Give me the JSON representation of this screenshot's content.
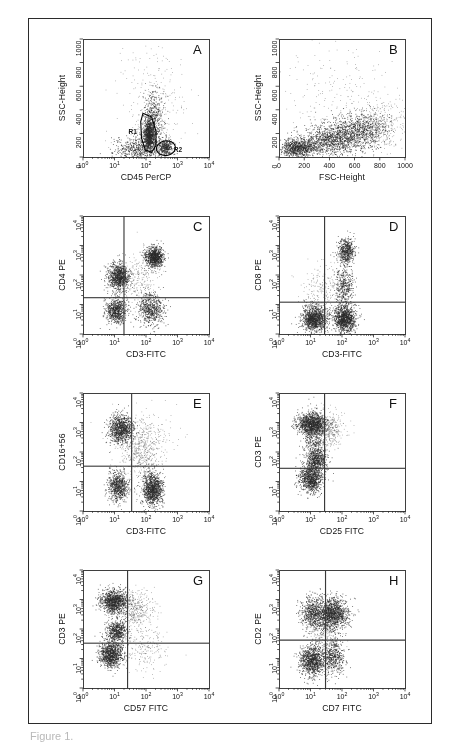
{
  "figure": {
    "caption_fragment": "Figure 1.",
    "panel_letters": [
      "A",
      "B",
      "C",
      "D",
      "E",
      "F",
      "G",
      "H"
    ],
    "colors": {
      "ink": "#1a1a1a",
      "frame": "#2b2b2b",
      "dot": "#2a2a2a",
      "quadrant": "#3a3a3a",
      "gate": "#000000",
      "background": "#ffffff"
    }
  },
  "chart_data": [
    {
      "id": "A",
      "type": "scatter",
      "title": "A",
      "xlabel": "CD45 PerCP",
      "ylabel": "SSC-Height",
      "x_scale": "log",
      "y_scale": "linear",
      "xlim": [
        1,
        10000
      ],
      "ylim": [
        0,
        1000
      ],
      "x_ticks": [
        "10^0",
        "10^1",
        "10^2",
        "10^3",
        "10^4"
      ],
      "y_ticks": [
        "0",
        "200",
        "400",
        "600",
        "800",
        "1000"
      ],
      "grid": false,
      "legend": "none",
      "n_events": 3000,
      "gates": [
        {
          "name": "R1",
          "shape": "polygon",
          "label": "R1",
          "label_xy": [
            28,
            210
          ],
          "vertices": [
            [
              80,
              370
            ],
            [
              150,
              340
            ],
            [
              210,
              215
            ],
            [
              205,
              95
            ],
            [
              150,
              40
            ],
            [
              95,
              60
            ],
            [
              72,
              160
            ],
            [
              68,
              300
            ]
          ]
        },
        {
          "name": "R2",
          "shape": "ellipse",
          "label": "R2",
          "label_xy": [
            760,
            60
          ],
          "center": [
            430,
            75
          ],
          "rx_log_decades": 0.3,
          "ry": 62,
          "rotation_deg": -8
        }
      ],
      "clusters": [
        {
          "name": "lymphocytes",
          "n": 900,
          "x_log_mean": 2.1,
          "x_log_sd": 0.09,
          "y_mean": 190,
          "y_sd": 65,
          "shape": "blob"
        },
        {
          "name": "monocytes",
          "n": 330,
          "x_log_mean": 2.62,
          "x_log_sd": 0.11,
          "y_mean": 80,
          "y_sd": 35,
          "shape": "blob"
        },
        {
          "name": "granulocytes",
          "n": 420,
          "x_log_mean": 2.22,
          "x_log_sd": 0.16,
          "y_mean": 330,
          "y_sd": 120,
          "shape": "blob"
        },
        {
          "name": "debris",
          "n": 520,
          "x_log_mean": 1.75,
          "x_log_sd": 0.38,
          "y_mean": 70,
          "y_sd": 55,
          "shape": "blob"
        },
        {
          "name": "scatter-noise",
          "n": 300,
          "x_log_mean": 2.25,
          "x_log_sd": 0.55,
          "y_mean": 430,
          "y_sd": 260,
          "shape": "sparse"
        }
      ]
    },
    {
      "id": "B",
      "type": "scatter",
      "title": "B",
      "xlabel": "FSC-Height",
      "ylabel": "SSC-Height",
      "x_scale": "linear",
      "y_scale": "linear",
      "xlim": [
        0,
        1000
      ],
      "ylim": [
        0,
        1000
      ],
      "x_ticks": [
        "0",
        "200",
        "400",
        "600",
        "800",
        "1000"
      ],
      "y_ticks": [
        "0",
        "200",
        "400",
        "600",
        "800",
        "1000"
      ],
      "grid": false,
      "legend": "none",
      "n_events": 3200,
      "gates": [],
      "clusters": [
        {
          "name": "low-fsc-dense",
          "n": 900,
          "x_mean": 150,
          "x_sd": 70,
          "y_mean": 75,
          "y_sd": 45,
          "shape": "blob"
        },
        {
          "name": "mid-diagonal",
          "n": 1000,
          "x_mean": 420,
          "x_sd": 120,
          "y_mean": 150,
          "y_sd": 65,
          "shape": "blob"
        },
        {
          "name": "upper-diagonal",
          "n": 750,
          "x_mean": 640,
          "x_sd": 110,
          "y_mean": 230,
          "y_sd": 75,
          "shape": "blob"
        },
        {
          "name": "high-fsc-tail",
          "n": 330,
          "x_mean": 820,
          "x_sd": 110,
          "y_mean": 280,
          "y_sd": 110,
          "shape": "sparse"
        },
        {
          "name": "sparse-upper",
          "n": 220,
          "x_mean": 480,
          "x_sd": 240,
          "y_mean": 520,
          "y_sd": 230,
          "shape": "sparse"
        }
      ]
    },
    {
      "id": "C",
      "type": "scatter",
      "title": "C",
      "xlabel": "CD3-FITC",
      "ylabel": "CD4 PE",
      "x_scale": "log",
      "y_scale": "log",
      "xlim": [
        1,
        10000
      ],
      "ylim": [
        1,
        10000
      ],
      "x_ticks": [
        "10^0",
        "10^1",
        "10^2",
        "10^3",
        "10^4"
      ],
      "y_ticks": [
        "10^0",
        "10^1",
        "10^2",
        "10^3",
        "10^4"
      ],
      "grid": false,
      "legend": "none",
      "n_events": 3400,
      "quadrant": {
        "x": 20,
        "y": 17
      },
      "gates": [],
      "clusters": [
        {
          "name": "cd3-neg-cd4-dim",
          "n": 950,
          "x_log_mean": 1.12,
          "x_log_sd": 0.17,
          "y_log_mean": 1.95,
          "y_log_sd": 0.22,
          "shape": "blob"
        },
        {
          "name": "cd3-pos-cd4-pos",
          "n": 900,
          "x_log_mean": 2.25,
          "x_log_sd": 0.14,
          "y_log_mean": 2.62,
          "y_log_sd": 0.17,
          "shape": "blob"
        },
        {
          "name": "double-negative",
          "n": 700,
          "x_log_mean": 1.05,
          "x_log_sd": 0.16,
          "y_log_mean": 0.8,
          "y_log_sd": 0.22,
          "shape": "blob"
        },
        {
          "name": "cd3-pos-cd4-neg",
          "n": 620,
          "x_log_mean": 2.15,
          "x_log_sd": 0.21,
          "y_log_mean": 0.85,
          "y_log_sd": 0.28,
          "shape": "blob"
        },
        {
          "name": "bridge",
          "n": 230,
          "x_log_mean": 1.8,
          "x_log_sd": 0.3,
          "y_log_mean": 1.9,
          "y_log_sd": 0.45,
          "shape": "sparse"
        }
      ]
    },
    {
      "id": "D",
      "type": "scatter",
      "title": "D",
      "xlabel": "CD3-FITC",
      "ylabel": "CD8 PE",
      "x_scale": "log",
      "y_scale": "log",
      "xlim": [
        1,
        10000
      ],
      "ylim": [
        1,
        10000
      ],
      "x_ticks": [
        "10^0",
        "10^1",
        "10^2",
        "10^3",
        "10^4"
      ],
      "y_ticks": [
        "10^0",
        "10^1",
        "10^2",
        "10^3",
        "10^4"
      ],
      "grid": false,
      "legend": "none",
      "n_events": 3400,
      "quadrant": {
        "x": 28,
        "y": 12
      },
      "gates": [],
      "clusters": [
        {
          "name": "cd3-pos-cd8-bright",
          "n": 520,
          "x_log_mean": 2.13,
          "x_log_sd": 0.13,
          "y_log_mean": 2.82,
          "y_log_sd": 0.2,
          "shape": "blob"
        },
        {
          "name": "cd3-neg-cd8-neg",
          "n": 1150,
          "x_log_mean": 1.12,
          "x_log_sd": 0.2,
          "y_log_mean": 0.52,
          "y_log_sd": 0.22,
          "shape": "blob"
        },
        {
          "name": "cd3-pos-cd8-neg",
          "n": 1100,
          "x_log_mean": 2.08,
          "x_log_sd": 0.17,
          "y_log_mean": 0.52,
          "y_log_sd": 0.22,
          "shape": "blob"
        },
        {
          "name": "cd8-dim-bridge",
          "n": 420,
          "x_log_mean": 2.05,
          "x_log_sd": 0.14,
          "y_log_mean": 1.6,
          "y_log_sd": 0.4,
          "shape": "blob"
        },
        {
          "name": "sparse-left",
          "n": 210,
          "x_log_mean": 1.35,
          "x_log_sd": 0.3,
          "y_log_mean": 1.5,
          "y_log_sd": 0.45,
          "shape": "sparse"
        }
      ]
    },
    {
      "id": "E",
      "type": "scatter",
      "title": "E",
      "xlabel": "CD3-FITC",
      "ylabel": "CD16+56",
      "x_scale": "log",
      "y_scale": "log",
      "xlim": [
        1,
        10000
      ],
      "ylim": [
        1,
        10000
      ],
      "x_ticks": [
        "10^0",
        "10^1",
        "10^2",
        "10^3",
        "10^4"
      ],
      "y_ticks": [
        "10^0",
        "10^1",
        "10^2",
        "10^3",
        "10^4"
      ],
      "grid": false,
      "legend": "none",
      "n_events": 3400,
      "quadrant": {
        "x": 35,
        "y": 33
      },
      "gates": [],
      "clusters": [
        {
          "name": "nk-cells",
          "n": 950,
          "x_log_mean": 1.2,
          "x_log_sd": 0.19,
          "y_log_mean": 2.78,
          "y_log_sd": 0.24,
          "shape": "blob"
        },
        {
          "name": "cd3-neg-cd16-neg",
          "n": 700,
          "x_log_mean": 1.1,
          "x_log_sd": 0.16,
          "y_log_mean": 0.85,
          "y_log_sd": 0.25,
          "shape": "blob"
        },
        {
          "name": "t-cells",
          "n": 1050,
          "x_log_mean": 2.2,
          "x_log_sd": 0.16,
          "y_log_mean": 0.75,
          "y_log_sd": 0.28,
          "shape": "blob"
        },
        {
          "name": "nkt-bridge",
          "n": 380,
          "x_log_mean": 1.85,
          "x_log_sd": 0.28,
          "y_log_mean": 1.9,
          "y_log_sd": 0.5,
          "shape": "sparse"
        },
        {
          "name": "upper-sparse",
          "n": 260,
          "x_log_mean": 2.0,
          "x_log_sd": 0.45,
          "y_log_mean": 2.4,
          "y_log_sd": 0.45,
          "shape": "sparse"
        }
      ]
    },
    {
      "id": "F",
      "type": "scatter",
      "title": "F",
      "xlabel": "CD25 FITC",
      "ylabel": "CD3 PE",
      "x_scale": "log",
      "y_scale": "log",
      "xlim": [
        1,
        10000
      ],
      "ylim": [
        1,
        10000
      ],
      "x_ticks": [
        "10^0",
        "10^1",
        "10^2",
        "10^3",
        "10^4"
      ],
      "y_ticks": [
        "10^0",
        "10^1",
        "10^2",
        "10^3",
        "10^4"
      ],
      "grid": false,
      "legend": "none",
      "n_events": 3400,
      "quadrant": {
        "x": 28,
        "y": 28
      },
      "gates": [],
      "clusters": [
        {
          "name": "cd3-bright-cd25-neg",
          "n": 1150,
          "x_log_mean": 1.02,
          "x_log_sd": 0.22,
          "y_log_mean": 2.95,
          "y_log_sd": 0.19,
          "shape": "blob"
        },
        {
          "name": "cd3-dim",
          "n": 520,
          "x_log_mean": 1.18,
          "x_log_sd": 0.16,
          "y_log_mean": 1.72,
          "y_log_sd": 0.19,
          "shape": "blob"
        },
        {
          "name": "cd3-neg",
          "n": 900,
          "x_log_mean": 1.0,
          "x_log_sd": 0.18,
          "y_log_mean": 1.1,
          "y_log_sd": 0.22,
          "shape": "blob"
        },
        {
          "name": "cd25-pos-tail",
          "n": 430,
          "x_log_mean": 1.55,
          "x_log_sd": 0.26,
          "y_log_mean": 2.75,
          "y_log_sd": 0.3,
          "shape": "sparse"
        },
        {
          "name": "bridge-vertical",
          "n": 330,
          "x_log_mean": 1.1,
          "x_log_sd": 0.16,
          "y_log_mean": 2.3,
          "y_log_sd": 0.4,
          "shape": "blob"
        }
      ]
    },
    {
      "id": "G",
      "type": "scatter",
      "title": "G",
      "xlabel": "CD57 FITC",
      "ylabel": "CD3 PE",
      "x_scale": "log",
      "y_scale": "log",
      "xlim": [
        1,
        10000
      ],
      "ylim": [
        1,
        10000
      ],
      "x_ticks": [
        "10^0",
        "10^1",
        "10^2",
        "10^3",
        "10^4"
      ],
      "y_ticks": [
        "10^0",
        "10^1",
        "10^2",
        "10^3",
        "10^4"
      ],
      "grid": false,
      "legend": "none",
      "n_events": 3400,
      "quadrant": {
        "x": 26,
        "y": 33
      },
      "gates": [],
      "clusters": [
        {
          "name": "cd3-bright",
          "n": 1050,
          "x_log_mean": 0.98,
          "x_log_sd": 0.22,
          "y_log_mean": 2.94,
          "y_log_sd": 0.19,
          "shape": "blob"
        },
        {
          "name": "cd3-dim-mid",
          "n": 560,
          "x_log_mean": 1.05,
          "x_log_sd": 0.17,
          "y_log_mean": 1.92,
          "y_log_sd": 0.2,
          "shape": "blob"
        },
        {
          "name": "cd3-neg-low",
          "n": 950,
          "x_log_mean": 0.88,
          "x_log_sd": 0.19,
          "y_log_mean": 1.15,
          "y_log_sd": 0.22,
          "shape": "blob"
        },
        {
          "name": "cd57-pos-tail",
          "n": 430,
          "x_log_mean": 1.65,
          "x_log_sd": 0.3,
          "y_log_mean": 2.7,
          "y_log_sd": 0.32,
          "shape": "sparse"
        },
        {
          "name": "cd57-pos-low",
          "n": 200,
          "x_log_mean": 1.95,
          "x_log_sd": 0.38,
          "y_log_mean": 1.3,
          "y_log_sd": 0.4,
          "shape": "sparse"
        }
      ]
    },
    {
      "id": "H",
      "type": "scatter",
      "title": "H",
      "xlabel": "CD7 FITC",
      "ylabel": "CD2 PE",
      "x_scale": "log",
      "y_scale": "log",
      "xlim": [
        1,
        10000
      ],
      "ylim": [
        1,
        10000
      ],
      "x_ticks": [
        "10^0",
        "10^1",
        "10^2",
        "10^3",
        "10^4"
      ],
      "y_ticks": [
        "10^0",
        "10^1",
        "10^2",
        "10^3",
        "10^4"
      ],
      "grid": false,
      "legend": "none",
      "n_events": 3600,
      "quadrant": {
        "x": 30,
        "y": 42
      },
      "gates": [],
      "clusters": [
        {
          "name": "cd2-pos-cd7-pos",
          "n": 1250,
          "x_log_mean": 1.7,
          "x_log_sd": 0.24,
          "y_log_mean": 2.52,
          "y_log_sd": 0.26,
          "shape": "blob"
        },
        {
          "name": "cd2-pos-cd7-dim",
          "n": 620,
          "x_log_mean": 1.1,
          "x_log_sd": 0.2,
          "y_log_mean": 2.55,
          "y_log_sd": 0.28,
          "shape": "blob"
        },
        {
          "name": "double-negative",
          "n": 1000,
          "x_log_mean": 1.05,
          "x_log_sd": 0.2,
          "y_log_mean": 0.95,
          "y_log_sd": 0.26,
          "shape": "blob"
        },
        {
          "name": "cd7-pos-cd2-neg",
          "n": 480,
          "x_log_mean": 1.72,
          "x_log_sd": 0.18,
          "y_log_mean": 1.05,
          "y_log_sd": 0.3,
          "shape": "blob"
        },
        {
          "name": "bridge",
          "n": 250,
          "x_log_mean": 1.45,
          "x_log_sd": 0.26,
          "y_log_mean": 1.8,
          "y_log_sd": 0.35,
          "shape": "sparse"
        }
      ]
    }
  ]
}
